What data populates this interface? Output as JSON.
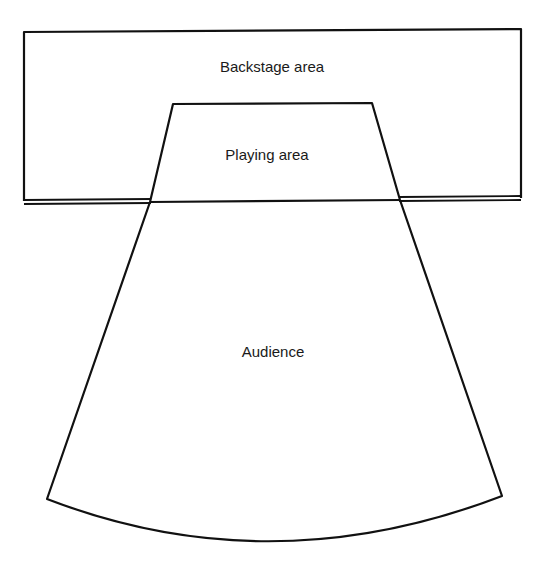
{
  "diagram": {
    "type": "theatre-stage-layout",
    "regions": {
      "backstage": {
        "label": "Backstage area"
      },
      "playing": {
        "label": "Playing area"
      },
      "audience": {
        "label": "Audience"
      }
    },
    "colors": {
      "stroke": "#111111",
      "background": "#ffffff",
      "text": "#1a1a1a"
    }
  }
}
